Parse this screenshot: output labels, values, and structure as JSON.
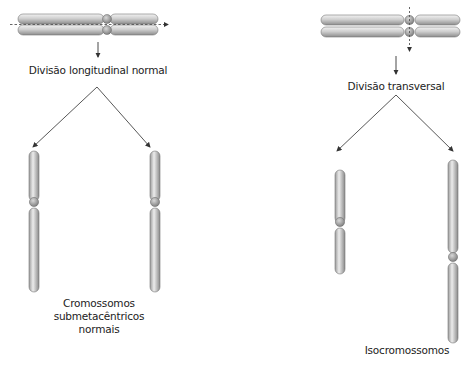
{
  "left_panel": {
    "process_label": "Divisão longitudinal normal",
    "result_label_lines": [
      "Cromossomos",
      "submetacêntricos",
      "normais"
    ]
  },
  "right_panel": {
    "process_label": "Divisão transversal",
    "result_label": "Isocromossomos"
  },
  "colors": {
    "chromatid_light": "#e6e6e6",
    "chromatid_dark": "#8a8a8a",
    "centromere": "#9a9a9a",
    "line": "#444444"
  }
}
